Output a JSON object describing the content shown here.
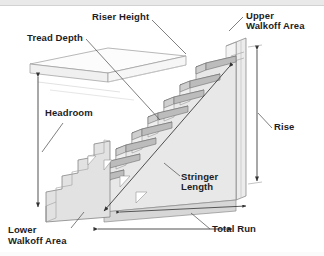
{
  "diagram": {
    "type": "isometric-technical-illustration",
    "background_color": "#ffffff",
    "line_color": "#3a3a3a",
    "label_color": "#1d1d1f",
    "fill_light": "#f4f4f4",
    "fill_mid": "#e4e4e4",
    "fill_dark": "#c9c9c9",
    "tread_edge": "#b4b4b4"
  },
  "labels": {
    "tread_depth": "Tread Depth",
    "riser_height": "Riser Height",
    "upper_walkoff_line1": "Upper",
    "upper_walkoff_line2": "Walkoff Area",
    "headroom": "Headroom",
    "rise": "Rise",
    "stringer_line1": "Stringer",
    "stringer_line2": "Length",
    "lower_walkoff_line1": "Lower",
    "lower_walkoff_line2": "Walkoff Area",
    "total_run": "Total Run"
  },
  "annotations": [
    {
      "name": "tread-depth",
      "text": "Tread Depth",
      "x": 27,
      "y": 33,
      "leader": true
    },
    {
      "name": "riser-height",
      "text": "Riser Height",
      "x": 92,
      "y": 12,
      "leader": true
    },
    {
      "name": "upper-walkoff",
      "text": "Upper Walkoff Area",
      "x": 245,
      "y": 12,
      "leader": true
    },
    {
      "name": "headroom",
      "text": "Headroom",
      "x": 45,
      "y": 107,
      "leader": true
    },
    {
      "name": "rise",
      "text": "Rise",
      "x": 274,
      "y": 121,
      "leader": true
    },
    {
      "name": "stringer-length",
      "text": "Stringer Length",
      "x": 181,
      "y": 171,
      "leader": true
    },
    {
      "name": "lower-walkoff",
      "text": "Lower Walkoff Area",
      "x": 8,
      "y": 224,
      "leader": true
    },
    {
      "name": "total-run",
      "text": "Total Run",
      "x": 212,
      "y": 223,
      "leader": true
    }
  ],
  "dimension_lines": [
    {
      "name": "headroom-dimension",
      "orientation": "vertical",
      "x": 38,
      "y1": 74,
      "y2": 210
    },
    {
      "name": "rise-dimension",
      "orientation": "vertical",
      "x": 257,
      "y1": 47,
      "y2": 183
    },
    {
      "name": "total-run-dimension",
      "orientation": "horizontal",
      "y": 229,
      "x1": 95,
      "x2": 234
    },
    {
      "name": "upper-run-dimension",
      "orientation": "horizontal",
      "y": 208,
      "x1": 118,
      "x2": 248
    }
  ],
  "stair": {
    "step_count": 9,
    "tread_rise_px": 14.5,
    "tread_run_px": 16.5
  }
}
